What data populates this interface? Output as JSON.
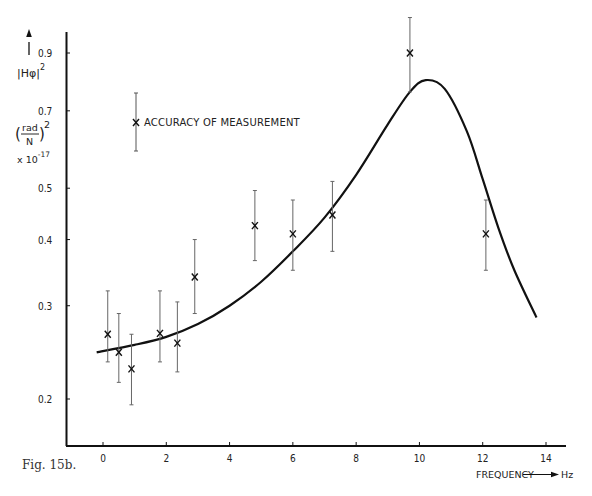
{
  "figure": {
    "caption": "Fig. 15b."
  },
  "axes": {
    "y_label_main": "|Hφ|",
    "y_label_exp": "2",
    "y_units_num": "rad",
    "y_units_den": "N",
    "y_units_exp": "2",
    "y_scale_prefix": "x 10",
    "y_scale_exp": "-17",
    "x_label": "FREQUENCY",
    "x_unit": "Hz"
  },
  "legend": {
    "label": "ACCURACY OF MEASUREMENT"
  },
  "chart_data": {
    "type": "scatter",
    "title": "",
    "xlabel": "FREQUENCY → Hz",
    "ylabel": "|Hφ|² (rad/N)² x10^-17",
    "x_ticks": [
      0,
      2,
      4,
      6,
      8,
      10,
      12,
      14
    ],
    "y_ticks": [
      0.2,
      0.3,
      0.4,
      0.5,
      0.7,
      0.9
    ],
    "y_scale": "log",
    "xlim": [
      -1.2,
      14.6
    ],
    "ylim": [
      0.17,
      1.0
    ],
    "grid": false,
    "legend_position": "upper-left",
    "series": [
      {
        "name": "Measured (x with error bar)",
        "type": "errorbar",
        "points": [
          {
            "x": 0.15,
            "y": 0.265,
            "ylow": 0.235,
            "yhigh": 0.32
          },
          {
            "x": 0.5,
            "y": 0.245,
            "ylow": 0.215,
            "yhigh": 0.29
          },
          {
            "x": 0.9,
            "y": 0.228,
            "ylow": 0.195,
            "yhigh": 0.265
          },
          {
            "x": 1.8,
            "y": 0.266,
            "ylow": 0.235,
            "yhigh": 0.32
          },
          {
            "x": 2.35,
            "y": 0.255,
            "ylow": 0.225,
            "yhigh": 0.305
          },
          {
            "x": 2.9,
            "y": 0.34,
            "ylow": 0.29,
            "yhigh": 0.4
          },
          {
            "x": 4.8,
            "y": 0.425,
            "ylow": 0.365,
            "yhigh": 0.495
          },
          {
            "x": 6.0,
            "y": 0.41,
            "ylow": 0.35,
            "yhigh": 0.475
          },
          {
            "x": 7.25,
            "y": 0.445,
            "ylow": 0.38,
            "yhigh": 0.515
          },
          {
            "x": 9.7,
            "y": 0.9,
            "ylow": 0.76,
            "yhigh": 1.05
          },
          {
            "x": 12.1,
            "y": 0.41,
            "ylow": 0.35,
            "yhigh": 0.475
          }
        ]
      },
      {
        "name": "Fitted curve",
        "type": "line",
        "x": [
          -0.2,
          1,
          2,
          3,
          4,
          5,
          6,
          7,
          8,
          9,
          9.7,
          10.2,
          10.8,
          11.5,
          12,
          12.5,
          13,
          13.7
        ],
        "y": [
          0.245,
          0.253,
          0.262,
          0.277,
          0.3,
          0.333,
          0.38,
          0.44,
          0.53,
          0.66,
          0.76,
          0.8,
          0.77,
          0.64,
          0.52,
          0.42,
          0.35,
          0.285
        ]
      }
    ]
  }
}
